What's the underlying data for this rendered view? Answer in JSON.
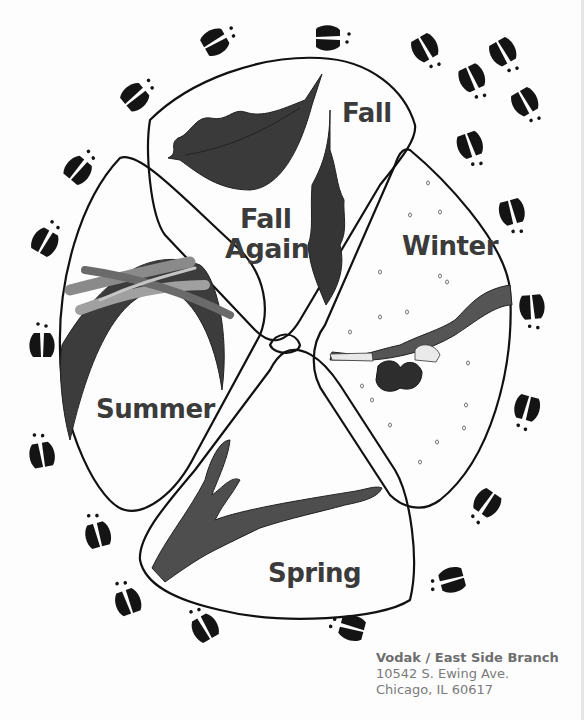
{
  "diagram": {
    "type": "seasonal cycle illustration",
    "sections": [
      {
        "id": "fall",
        "label": "Fall",
        "illustration": "falling-leaf"
      },
      {
        "id": "fall-again",
        "label_line1": "Fall",
        "label_line2": "Again",
        "illustration": "oak-leaf"
      },
      {
        "id": "winter",
        "label": "Winter",
        "illustration": "snowy-branch-with-bud"
      },
      {
        "id": "summer",
        "label": "Summer",
        "illustration": "seed-wings-and-curved-blade"
      },
      {
        "id": "spring",
        "label": "Spring",
        "illustration": "budding-branch"
      }
    ],
    "border_motif": "deer-tracks",
    "colors": {
      "outline": "#111111",
      "fill_dark": "#3a3a3a",
      "fill_mid": "#5e5e5e",
      "fill_light": "#9a9a9a",
      "label": "#3b3b3b",
      "address": "#7a7a7a"
    }
  },
  "address": {
    "line1": "Vodak / East Side Branch",
    "line2": "10542 S. Ewing Ave.",
    "line3": "Chicago, IL  60617"
  }
}
